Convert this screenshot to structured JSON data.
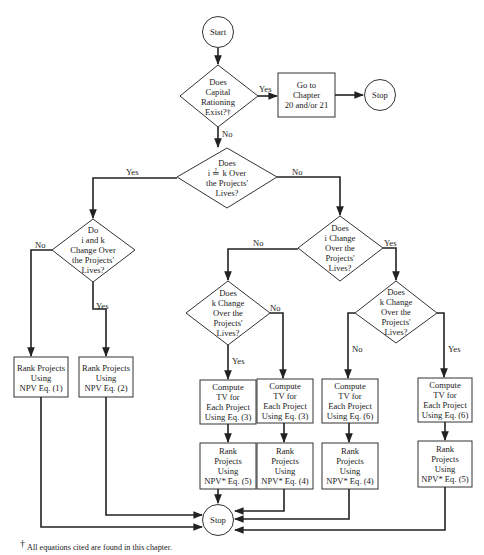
{
  "nodes": {
    "start": {
      "label": "Start"
    },
    "capital_rationing": {
      "lines": [
        "Does",
        "Capital",
        "Rationing",
        "Exist?†"
      ]
    },
    "go_chapter": {
      "lines": [
        "Go to",
        "Chapter",
        "20 and/or 21"
      ]
    },
    "stop_top": {
      "label": "Stop"
    },
    "i_eq_k": {
      "lines": [
        "Does",
        "i ≟ k Over",
        "the Projects'",
        "Lives?"
      ]
    },
    "i_and_k_change": {
      "lines": [
        "Do",
        "i and k",
        "Change Over",
        "the Projects'",
        "Lives?"
      ]
    },
    "i_change": {
      "lines": [
        "Does",
        "i Change",
        "Over the",
        "Projects'",
        "Lives?"
      ]
    },
    "k_change_left": {
      "lines": [
        "Does",
        "k Change",
        "Over the",
        "Projects'",
        "Lives?"
      ]
    },
    "k_change_right": {
      "lines": [
        "Does",
        "k Change",
        "Over the",
        "Projects'",
        "Lives?"
      ]
    },
    "rank_npv1": {
      "lines": [
        "Rank Projects",
        "Using",
        "NPV Eq. (1)"
      ]
    },
    "rank_npv2": {
      "lines": [
        "Rank Projects",
        "Using",
        "NPV Eq. (2)"
      ]
    },
    "compute_tv3_a": {
      "lines": [
        "Compute",
        "TV for",
        "Each Project",
        "Using Eq. (3)"
      ]
    },
    "compute_tv3_b": {
      "lines": [
        "Compute",
        "TV for",
        "Each Project",
        "Using Eq. (3)"
      ]
    },
    "compute_tv6_a": {
      "lines": [
        "Compute",
        "TV for",
        "Each Project",
        "Using Eq. (6)"
      ]
    },
    "compute_tv6_b": {
      "lines": [
        "Compute",
        "TV for",
        "Each Project",
        "Using Eq. (6)"
      ]
    },
    "rank_npvs5_a": {
      "lines": [
        "Rank",
        "Projects",
        "Using",
        "NPV* Eq. (5)"
      ]
    },
    "rank_npvs4_a": {
      "lines": [
        "Rank",
        "Projects",
        "Using",
        "NPV* Eq. (4)"
      ]
    },
    "rank_npvs4_b": {
      "lines": [
        "Rank",
        "Projects",
        "Using",
        "NPV* Eq. (4)"
      ]
    },
    "rank_npvs5_b": {
      "lines": [
        "Rank",
        "Projects",
        "Using",
        "NPV* Eq. (5)"
      ]
    },
    "stop_bottom": {
      "label": "Stop"
    }
  },
  "edges": {
    "capital_yes": "Yes",
    "capital_no": "No",
    "ieqk_yes": "Yes",
    "ieqk_no": "No",
    "iandk_no": "No",
    "iandk_yes": "Yes",
    "ichange_no": "No",
    "ichange_yes": "Yes",
    "kleft_no": "No",
    "kleft_yes": "Yes",
    "kright_no": "No",
    "kright_yes": "Yes"
  },
  "footnote": {
    "mark": "†",
    "text": "All equations cited are found in this chapter."
  }
}
